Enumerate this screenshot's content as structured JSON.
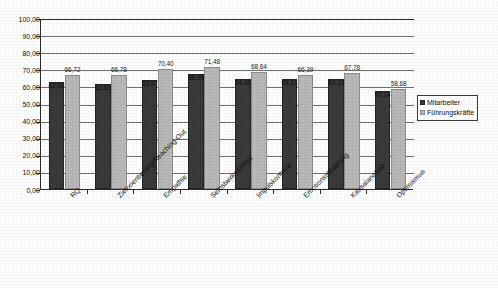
{
  "chart_data": {
    "type": "bar",
    "title": "",
    "xlabel": "",
    "ylabel": "",
    "ylim": [
      0,
      100
    ],
    "ytick_step": 10,
    "grid": true,
    "legend_position": "right",
    "decimal_separator": ",",
    "categories": [
      "RQ",
      "Zielorientierung/Reaching-Out",
      "Empathie",
      "Selbstwirksamkeit",
      "Impulskontrolle",
      "Emotionssteuerung",
      "Kausalanalyse",
      "Optimismus"
    ],
    "ytick_labels": [
      "100,00",
      "90,00",
      "80,00",
      "70,00",
      "60,00",
      "50,00",
      "40,00",
      "30,00",
      "20,00",
      "10,00",
      "0,00"
    ],
    "series": [
      {
        "name": "Mitarbeiter",
        "color": "#3a3a3a",
        "values": [
          62.62,
          61.53,
          63.97,
          66.98,
          64.48,
          64.13,
          64.1,
          57.14
        ],
        "labels": [
          "62,62",
          "61,53",
          "63,97",
          "66,98",
          "64,48",
          "64,13",
          "64,10",
          "57,14"
        ]
      },
      {
        "name": "Führungskräfte",
        "color": "#b9b9b9",
        "values": [
          66.72,
          66.78,
          70.4,
          71.48,
          68.64,
          66.39,
          67.78,
          58.68
        ],
        "labels": [
          "66,72",
          "66,78",
          "70,40",
          "71,48",
          "68,64",
          "66,39",
          "67,78",
          "58,68"
        ]
      }
    ]
  },
  "legend": {
    "items": [
      {
        "label": "Mitarbeiter",
        "color": "#3a3a3a"
      },
      {
        "label": "Führungskräfte",
        "color": "#b9b9b9"
      }
    ]
  }
}
